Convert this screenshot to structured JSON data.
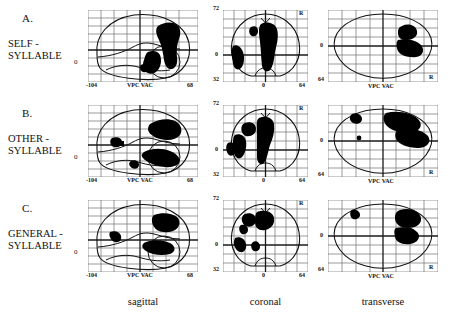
{
  "figure": {
    "views": [
      {
        "key": "sagittal",
        "caption": "sagittal"
      },
      {
        "key": "coronal",
        "caption": "coronal"
      },
      {
        "key": "transverse",
        "caption": "transverse"
      }
    ],
    "rows": [
      {
        "letter": "A.",
        "name_line1": "SELF -",
        "name_line2": "SYLLABLE",
        "zero_label": "0"
      },
      {
        "letter": "B.",
        "name_line1": "OTHER -",
        "name_line2": "SYLLABLE",
        "zero_label": "0"
      },
      {
        "letter": "C.",
        "name_line1": "GENERAL -",
        "name_line2": "SYLLABLE",
        "zero_label": "0"
      }
    ],
    "axes": {
      "sagittal": {
        "left_tick": "-104",
        "right_tick": "68",
        "origin_tick": "0",
        "landmarks": "VPC  VAC"
      },
      "coronal": {
        "top_tick": "72",
        "bottom_tick": "32",
        "center_tick": "0",
        "right_tick": "64",
        "hemisphere_marker": "R"
      },
      "transverse": {
        "left_tick": "0",
        "bottom_left_tick": "64",
        "landmarks": "VPC  VAC",
        "hemisphere_marker": "R"
      }
    },
    "colors": {
      "activation": "#000000",
      "outline": "#1a1a1a",
      "grid": "#6e6e6e",
      "background": "#ffffff"
    }
  }
}
